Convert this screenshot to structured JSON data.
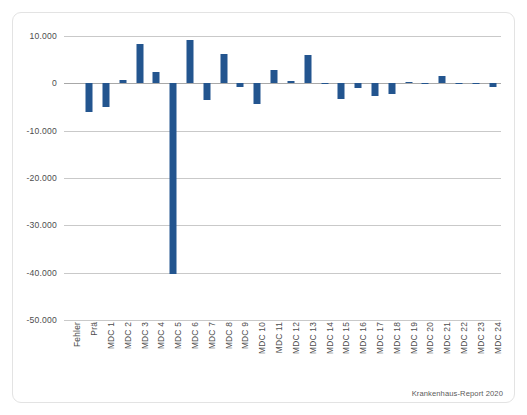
{
  "source_note": "Krankenhaus-Report 2020",
  "colors": {
    "bar": "#23558f",
    "grid": "#c9c9c9",
    "zero_line": "#a8a8a8",
    "frame": "#e3e3e3",
    "text": "#4d4d4d",
    "background": "#ffffff"
  },
  "axis": {
    "y_ticks": [
      "10.000",
      "0",
      "-10.000",
      "-20.000",
      "-30.000",
      "-40.000",
      "-50.000"
    ],
    "y_tick_values": [
      10000,
      0,
      -10000,
      -20000,
      -30000,
      -40000,
      -50000
    ]
  },
  "chart_data": {
    "type": "bar",
    "title": "",
    "subtitle": "",
    "xlabel": "",
    "ylabel": "",
    "ylim": [
      -50000,
      10000
    ],
    "grid": true,
    "legend": "none",
    "yticks": [
      10000,
      0,
      -10000,
      -20000,
      -30000,
      -40000,
      -50000
    ],
    "ytick_labels": [
      "10.000",
      "0",
      "-10.000",
      "-20.000",
      "-30.000",
      "-40.000",
      "-50.000"
    ],
    "categories": [
      "Fehler",
      "Prä",
      "MDC 1",
      "MDC 2",
      "MDC 3",
      "MDC 4",
      "MDC 5",
      "MDC 6",
      "MDC 7",
      "MDC 8",
      "MDC 9",
      "MDC 10",
      "MDC 11",
      "MDC 12",
      "MDC 13",
      "MDC 14",
      "MDC 15",
      "MDC 16",
      "MDC 17",
      "MDC 18",
      "MDC 19",
      "MDC 20",
      "MDC 21",
      "MDC 22",
      "MDC 23",
      "MDC 24"
    ],
    "values": [
      0,
      -6000,
      -5100,
      700,
      8300,
      2500,
      -40200,
      9100,
      -3600,
      6100,
      -800,
      -4400,
      2800,
      400,
      6000,
      -100,
      -3400,
      -900,
      -2700,
      -2300,
      200,
      -100,
      1600,
      -100,
      -100,
      -700
    ],
    "annotations": [
      "Krankenhaus-Report 2020"
    ]
  }
}
